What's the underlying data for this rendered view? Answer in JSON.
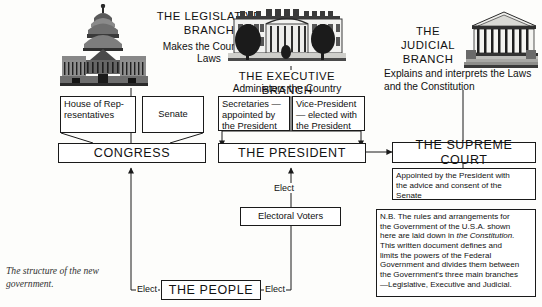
{
  "caption": "The structure of the new government.",
  "branches": {
    "legislative": {
      "title": "THE LEGISLATIVE BRANCH",
      "subtitle": "Makes the Country's Laws",
      "icon": "capitol-building-icon"
    },
    "executive": {
      "title": "THE EXECUTIVE BRANCH",
      "subtitle": "Administers the Country",
      "icon": "white-house-icon"
    },
    "judicial": {
      "title": "THE JUDICIAL BRANCH",
      "subtitle": "Explains and interprets the Laws and the Constitution",
      "icon": "supreme-court-building-icon"
    }
  },
  "boxes": {
    "house": "House of Rep-\nresentatives",
    "house_line1": "House of Rep-",
    "house_line2": "resentatives",
    "senate": "Senate",
    "congress": "CONGRESS",
    "secretaries_line1": "Secretaries —",
    "secretaries_line2": "appointed by",
    "secretaries_line3": "the President",
    "vicepresident_line1": "Vice-President",
    "vicepresident_line2": "— elected with",
    "vicepresident_line3": "the President",
    "president": "THE PRESIDENT",
    "supreme_court": "THE SUPREME COURT",
    "appointed_note_line1": "Appointed by the President with",
    "appointed_note_line2": "the advice and consent of the",
    "appointed_note_line3": "Senate",
    "electoral_voters": "Electoral Voters",
    "the_people": "THE PEOPLE"
  },
  "nb": {
    "line1": "N.B. The rules and arrangements for",
    "line2": "the Government of the U.S.A. shown",
    "line3_a": "here are laid down in ",
    "line3_italic": "the Constitution",
    "line3_b": ".",
    "line4": "This written document defines and",
    "line5": "limits the powers  of the Federal",
    "line6": "Government and divides them between",
    "line7": "the Government's three main branches",
    "line8": "—Legislative, Executive and Judicial."
  },
  "labels": {
    "elect_left": "Elect",
    "elect_right": "Elect",
    "elect_up": "Elect"
  },
  "colors": {
    "ink": "#111111",
    "paper": "#fdfdfb",
    "line": "#1a1a1a"
  }
}
